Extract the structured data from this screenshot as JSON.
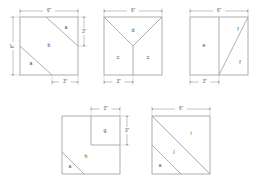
{
  "diagram": {
    "stroke_color": "#9a9a9a",
    "fill_color": "#ffffff",
    "label_color": "#4a4a4a",
    "dimension_color": "#555555",
    "background": "#ffffff"
  },
  "figures": [
    {
      "id": "figure-1",
      "name": "square-diagonal-two-cuts",
      "regions": [
        {
          "key": "r1",
          "label": "a"
        },
        {
          "key": "r2",
          "label": "b"
        },
        {
          "key": "r3",
          "label": "a"
        }
      ],
      "dimensions": [
        {
          "key": "top",
          "label": "6\"",
          "orientation": "horizontal"
        },
        {
          "key": "left",
          "label": "6\"",
          "orientation": "vertical"
        },
        {
          "key": "right",
          "label": "3\"",
          "orientation": "vertical"
        },
        {
          "key": "bottom",
          "label": "3\"",
          "orientation": "horizontal"
        }
      ]
    },
    {
      "id": "figure-2",
      "name": "square-y-cut",
      "regions": [
        {
          "key": "r1",
          "label": "c"
        },
        {
          "key": "r2",
          "label": "d"
        },
        {
          "key": "r3",
          "label": "c"
        }
      ],
      "dimensions": [
        {
          "key": "top",
          "label": "6\"",
          "orientation": "horizontal"
        },
        {
          "key": "bottom",
          "label": "3\"",
          "orientation": "horizontal"
        }
      ]
    },
    {
      "id": "figure-3",
      "name": "square-vertical-split-diagonal",
      "regions": [
        {
          "key": "r1",
          "label": "e"
        },
        {
          "key": "r2",
          "label": "f"
        },
        {
          "key": "r3",
          "label": "f"
        }
      ],
      "dimensions": [
        {
          "key": "top",
          "label": "6\"",
          "orientation": "horizontal"
        },
        {
          "key": "bottom",
          "label": "3\"",
          "orientation": "horizontal"
        }
      ]
    },
    {
      "id": "figure-4",
      "name": "square-inner-square-and-corner-triangle",
      "regions": [
        {
          "key": "r1",
          "label": "g"
        },
        {
          "key": "r2",
          "label": "h"
        },
        {
          "key": "r3",
          "label": "a"
        }
      ],
      "dimensions": [
        {
          "key": "top",
          "label": "3\"",
          "orientation": "horizontal"
        },
        {
          "key": "right",
          "label": "3\"",
          "orientation": "vertical"
        }
      ]
    },
    {
      "id": "figure-5",
      "name": "square-two-parallel-diagonals",
      "regions": [
        {
          "key": "r1",
          "label": "i"
        },
        {
          "key": "r2",
          "label": "j"
        },
        {
          "key": "r3",
          "label": "a"
        }
      ],
      "dimensions": [
        {
          "key": "top",
          "label": "6\"",
          "orientation": "horizontal"
        }
      ]
    }
  ]
}
